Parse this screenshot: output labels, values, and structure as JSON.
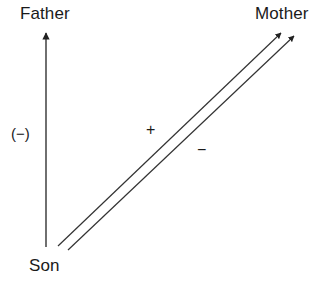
{
  "diagram": {
    "background_color": "#ffffff",
    "line_color": "#222222",
    "text_color": "#1a1a1a",
    "nodes": [
      {
        "id": "father",
        "label": "Father",
        "x": 20,
        "y": 4
      },
      {
        "id": "mother",
        "label": "Mother",
        "x": 255,
        "y": 4
      },
      {
        "id": "son",
        "label": "Son",
        "x": 29,
        "y": 256
      }
    ],
    "signs": [
      {
        "id": "minus-paren",
        "label": "(−)",
        "x": 11,
        "y": 125,
        "meaning": "negative-effect-son-to-father"
      },
      {
        "id": "plus",
        "label": "+",
        "x": 146,
        "y": 121,
        "meaning": "positive-effect-upper-path"
      },
      {
        "id": "minus",
        "label": "−",
        "x": 197,
        "y": 141,
        "meaning": "negative-effect-lower-path"
      }
    ],
    "arrows": [
      {
        "id": "son-to-father",
        "from": "son",
        "to": "father",
        "x1": 46,
        "y1": 247,
        "x2": 46,
        "y2": 30,
        "sign": "(−)"
      },
      {
        "id": "son-to-mother-upper",
        "from": "son",
        "to": "mother",
        "x1": 58,
        "y1": 246,
        "x2": 284,
        "y2": 30,
        "sign": "+"
      },
      {
        "id": "son-to-mother-lower",
        "from": "son",
        "to": "mother",
        "x1": 68,
        "y1": 250,
        "x2": 297,
        "y2": 33,
        "sign": "−"
      }
    ]
  }
}
